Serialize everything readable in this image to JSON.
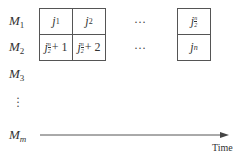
{
  "machines": [
    {
      "base": "M",
      "sub": "1"
    },
    {
      "base": "M",
      "sub": "2"
    },
    {
      "base": "M",
      "sub": "3"
    },
    {
      "base": "M",
      "sub": "m"
    }
  ],
  "vertical_ellipsis": "⋮",
  "row1": {
    "cells": [
      {
        "base": "j",
        "sub": "1"
      },
      {
        "base": "j",
        "sub": "2"
      }
    ],
    "ellipsis": "…",
    "last": {
      "base": "j",
      "frac_num": "n",
      "frac_den": "2"
    }
  },
  "row2": {
    "cells": [
      {
        "base": "j",
        "frac_num": "n",
        "frac_den": "2",
        "suffix": "+ 1"
      },
      {
        "base": "j",
        "frac_num": "n",
        "frac_den": "2",
        "suffix": "+ 2"
      }
    ],
    "ellipsis": "…",
    "last": {
      "base": "j",
      "sub": "n"
    }
  },
  "axis": {
    "label": "Time"
  },
  "colors": {
    "line": "#555555",
    "text": "#333333"
  }
}
